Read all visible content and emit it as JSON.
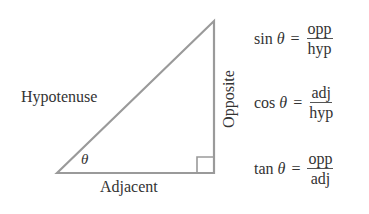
{
  "diagram": {
    "type": "right-triangle",
    "labels": {
      "hypotenuse": "Hypotenuse",
      "opposite": "Opposite",
      "adjacent": "Adjacent",
      "angle": "θ"
    },
    "stroke_color": "#999999"
  },
  "formulas": [
    {
      "fn": "sin",
      "var": "θ",
      "eq": "=",
      "num": "opp",
      "den": "hyp"
    },
    {
      "fn": "cos",
      "var": "θ",
      "eq": "=",
      "num": "adj",
      "den": "hyp"
    },
    {
      "fn": "tan",
      "var": "θ",
      "eq": "=",
      "num": "opp",
      "den": "adj"
    }
  ]
}
